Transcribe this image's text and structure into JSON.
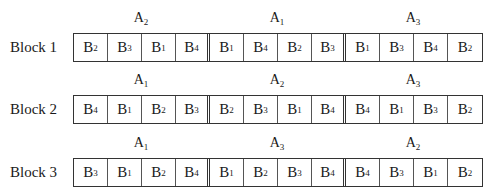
{
  "diagram": {
    "type": "randomized-block-layout",
    "rows": [
      {
        "label": "Block 1",
        "groups": [
          {
            "main": "A",
            "main_sub": "2",
            "plots": [
              [
                "B",
                "2"
              ],
              [
                "B",
                "3"
              ],
              [
                "B",
                "1"
              ],
              [
                "B",
                "4"
              ]
            ]
          },
          {
            "main": "A",
            "main_sub": "1",
            "plots": [
              [
                "B",
                "1"
              ],
              [
                "B",
                "4"
              ],
              [
                "B",
                "2"
              ],
              [
                "B",
                "3"
              ]
            ]
          },
          {
            "main": "A",
            "main_sub": "3",
            "plots": [
              [
                "B",
                "1"
              ],
              [
                "B",
                "3"
              ],
              [
                "B",
                "4"
              ],
              [
                "B",
                "2"
              ]
            ]
          }
        ]
      },
      {
        "label": "Block 2",
        "groups": [
          {
            "main": "A",
            "main_sub": "1",
            "plots": [
              [
                "B",
                "4"
              ],
              [
                "B",
                "1"
              ],
              [
                "B",
                "2"
              ],
              [
                "B",
                "3"
              ]
            ]
          },
          {
            "main": "A",
            "main_sub": "2",
            "plots": [
              [
                "B",
                "2"
              ],
              [
                "B",
                "3"
              ],
              [
                "B",
                "1"
              ],
              [
                "B",
                "4"
              ]
            ]
          },
          {
            "main": "A",
            "main_sub": "3",
            "plots": [
              [
                "B",
                "4"
              ],
              [
                "B",
                "1"
              ],
              [
                "B",
                "3"
              ],
              [
                "B",
                "2"
              ]
            ]
          }
        ]
      },
      {
        "label": "Block 3",
        "groups": [
          {
            "main": "A",
            "main_sub": "1",
            "plots": [
              [
                "B",
                "3"
              ],
              [
                "B",
                "1"
              ],
              [
                "B",
                "2"
              ],
              [
                "B",
                "4"
              ]
            ]
          },
          {
            "main": "A",
            "main_sub": "3",
            "plots": [
              [
                "B",
                "1"
              ],
              [
                "B",
                "2"
              ],
              [
                "B",
                "3"
              ],
              [
                "B",
                "4"
              ]
            ]
          },
          {
            "main": "A",
            "main_sub": "2",
            "plots": [
              [
                "B",
                "4"
              ],
              [
                "B",
                "3"
              ],
              [
                "B",
                "1"
              ],
              [
                "B",
                "2"
              ]
            ]
          }
        ]
      }
    ]
  }
}
